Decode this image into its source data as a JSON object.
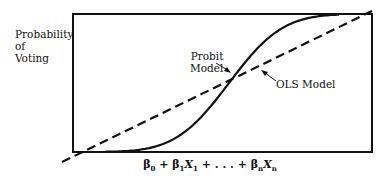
{
  "chart_data": {
    "type": "line",
    "title": "",
    "ylabel": "Probability of Voting",
    "ylabel_lines": [
      "Probability",
      "of",
      "Voting"
    ],
    "xlabel": "β0 + β1X1 + . . . + βnXn",
    "xlabel_parts": [
      {
        "sym": "β",
        "sub": "0"
      },
      {
        "text": " + "
      },
      {
        "sym": "β",
        "sub": "1"
      },
      {
        "sym": "X",
        "sub": "1"
      },
      {
        "text": " + . . . + "
      },
      {
        "sym": "β",
        "sub": "n"
      },
      {
        "sym": "X",
        "sub": "n"
      }
    ],
    "grid": false,
    "legend": "none",
    "ylim": [
      0,
      1
    ],
    "series": [
      {
        "name": "Probit Model",
        "style": "solid",
        "shape": "S-curve (cumulative normal)",
        "color": "#111111"
      },
      {
        "name": "OLS Model",
        "style": "dashed",
        "shape": "straight line extending beyond 0 and 1",
        "color": "#111111"
      }
    ],
    "annotations": [
      {
        "text_lines": [
          "Probit",
          "Model"
        ],
        "points_to": "Probit Model"
      },
      {
        "text_lines": [
          "OLS Model"
        ],
        "points_to": "OLS Model"
      }
    ]
  },
  "colors": {
    "line": "#111111",
    "background": "#ffffff"
  }
}
